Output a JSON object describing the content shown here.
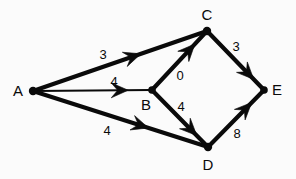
{
  "figure": {
    "name": "weighted-directed-graph",
    "background_color": "#fbfbfb",
    "stroke_color": "#0a0a0a",
    "text_color": "#0a0a0a",
    "width": 296,
    "height": 179
  },
  "graph": {
    "type": "directed-weighted-graph",
    "nodes": [
      {
        "id": "A",
        "label": "A",
        "x": 33,
        "y": 91,
        "label_x": 18,
        "label_y": 90,
        "radius": 4.2
      },
      {
        "id": "B",
        "label": "B",
        "x": 152,
        "y": 90,
        "label_x": 146,
        "label_y": 104,
        "radius": 3.8
      },
      {
        "id": "C",
        "label": "C",
        "x": 207,
        "y": 31,
        "label_x": 207,
        "label_y": 14,
        "radius": 4.2
      },
      {
        "id": "D",
        "label": "D",
        "x": 208,
        "y": 147,
        "label_x": 208,
        "label_y": 164,
        "radius": 4.2
      },
      {
        "id": "E",
        "label": "E",
        "x": 264,
        "y": 90,
        "label_x": 277,
        "label_y": 89,
        "radius": 3.8
      }
    ],
    "edges": [
      {
        "id": "A-C",
        "from": "A",
        "to": "C",
        "weight": "3",
        "weight_x": 103,
        "weight_y": 54,
        "arrow_t": 0.62,
        "stroke_width": 4.2
      },
      {
        "id": "A-B",
        "from": "A",
        "to": "B",
        "weight": "4",
        "weight_x": 114,
        "weight_y": 81,
        "arrow_t": 0.8,
        "stroke_width": 2.0
      },
      {
        "id": "A-D",
        "from": "A",
        "to": "D",
        "weight": "4",
        "weight_x": 107,
        "weight_y": 130,
        "arrow_t": 0.66,
        "stroke_width": 4.2
      },
      {
        "id": "B-C",
        "from": "B",
        "to": "C",
        "weight": "0",
        "weight_x": 180,
        "weight_y": 75,
        "arrow_t": 0.78,
        "stroke_width": 4.2
      },
      {
        "id": "B-D",
        "from": "B",
        "to": "D",
        "weight": "4",
        "weight_x": 181,
        "weight_y": 106,
        "arrow_t": 0.8,
        "stroke_width": 4.2
      },
      {
        "id": "C-E",
        "from": "C",
        "to": "E",
        "weight": "3",
        "weight_x": 236,
        "weight_y": 46,
        "arrow_t": 0.82,
        "stroke_width": 4.2
      },
      {
        "id": "D-E",
        "from": "D",
        "to": "E",
        "weight": "8",
        "weight_x": 237,
        "weight_y": 133,
        "arrow_t": 0.78,
        "stroke_width": 4.2
      }
    ]
  },
  "chart_data": {
    "type": "diagram",
    "title": "",
    "nodes": [
      "A",
      "B",
      "C",
      "D",
      "E"
    ],
    "edges": [
      {
        "from": "A",
        "to": "C",
        "weight": 3
      },
      {
        "from": "A",
        "to": "B",
        "weight": 4
      },
      {
        "from": "A",
        "to": "D",
        "weight": 4
      },
      {
        "from": "B",
        "to": "C",
        "weight": 0
      },
      {
        "from": "B",
        "to": "D",
        "weight": 4
      },
      {
        "from": "C",
        "to": "E",
        "weight": 3
      },
      {
        "from": "D",
        "to": "E",
        "weight": 8
      }
    ]
  }
}
